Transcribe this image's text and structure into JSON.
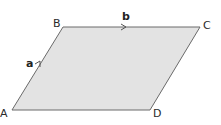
{
  "diagram": {
    "type": "parallelogram",
    "fill_color": "#e3e3e3",
    "stroke_color": "#6a6a6a",
    "vertices": [
      {
        "label": "A",
        "x": 12,
        "y": 110
      },
      {
        "label": "B",
        "x": 63,
        "y": 27
      },
      {
        "label": "C",
        "x": 200,
        "y": 27
      },
      {
        "label": "D",
        "x": 150,
        "y": 110
      }
    ],
    "vectors": [
      {
        "label": "a",
        "from": "A",
        "to": "B"
      },
      {
        "label": "b",
        "from": "B",
        "to": "C"
      }
    ]
  }
}
